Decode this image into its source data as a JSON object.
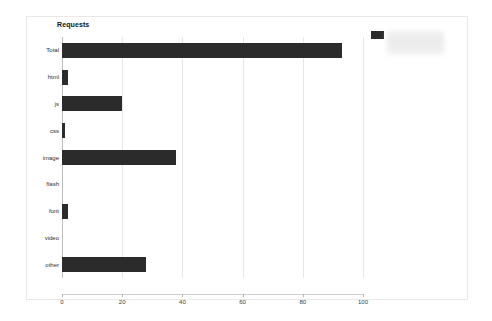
{
  "chart": {
    "title": "Requests",
    "legend": {
      "swatch_color": "#2b2b2b",
      "label": "",
      "obscured": true
    }
  },
  "chart_data": {
    "type": "bar",
    "orientation": "horizontal",
    "title": "Requests",
    "xlabel": "",
    "ylabel": "",
    "categories": [
      "Total",
      "html",
      "js",
      "css",
      "image",
      "flash",
      "font",
      "video",
      "other"
    ],
    "values": [
      93,
      2,
      20,
      1,
      38,
      0,
      2,
      0,
      28
    ],
    "series": [
      {
        "name": "Requests",
        "color": "#2b2b2b",
        "values": [
          93,
          2,
          20,
          1,
          38,
          0,
          2,
          0,
          28
        ]
      }
    ],
    "xlim": [
      0,
      100
    ],
    "xticks": [
      0,
      20,
      40,
      60,
      80,
      100
    ],
    "xtick_labels": [
      "0",
      "20",
      "40",
      "60",
      "80",
      "100"
    ],
    "grid": true,
    "grid_axis": "x",
    "legend_position": "top-right",
    "bar_color": "#2b2b2b"
  }
}
